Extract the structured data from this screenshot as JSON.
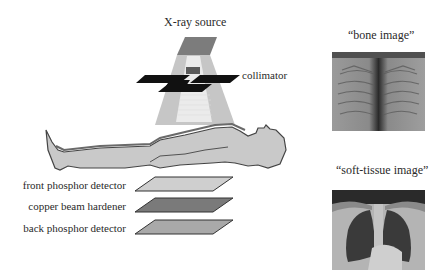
{
  "labels": {
    "source": "X-ray source",
    "collimator": "collimator",
    "front_detector": "front phosphor detector",
    "copper": "copper beam hardener",
    "back_detector": "back phosphor detector",
    "bone_image": "“bone image”",
    "soft_tissue_image": "“soft-tissue image”"
  },
  "colors": {
    "beam": "#c8c8c8",
    "beam_core": "#ececec",
    "source_top": "#7a7a7a",
    "collimator": "#111111",
    "body_fill": "#c9c9c9",
    "body_outline": "#4a4a4a",
    "front_detector": "#cfcfcf",
    "copper": "#7a7a7a",
    "back_detector": "#a9a9a9"
  }
}
